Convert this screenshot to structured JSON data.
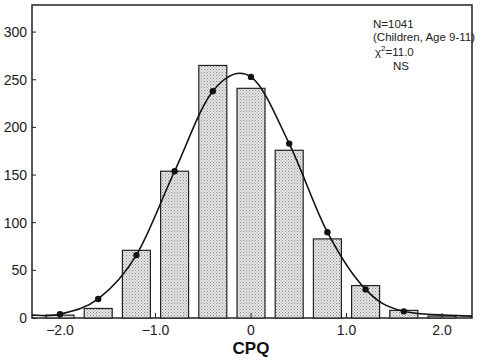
{
  "chart_data": {
    "type": "bar",
    "title": "",
    "xlabel": "CPQ",
    "ylabel": "",
    "xlim": [
      -2.3,
      2.05
    ],
    "ylim": [
      0,
      300
    ],
    "grid": false,
    "x_ticks": [
      -2.0,
      -1.0,
      0,
      1.0,
      2.0
    ],
    "x_tick_labels": [
      "−2.0",
      "−1.0",
      "0",
      "1.0",
      "2.0"
    ],
    "y_ticks": [
      0,
      50,
      100,
      150,
      200,
      250,
      300
    ],
    "y_tick_labels": [
      "0",
      "50",
      "100",
      "150",
      "200",
      "250",
      "300"
    ],
    "categories": [
      -2.0,
      -1.6,
      -1.2,
      -0.8,
      -0.4,
      0.0,
      0.4,
      0.8,
      1.2,
      1.6,
      2.0
    ],
    "series": [
      {
        "name": "Observed frequency",
        "type": "bar",
        "x": [
          -2.0,
          -1.6,
          -1.2,
          -0.8,
          -0.4,
          0.0,
          0.4,
          0.8,
          1.2,
          1.6,
          2.0
        ],
        "values": [
          3,
          10,
          71,
          154,
          265,
          241,
          176,
          83,
          34,
          8,
          2
        ]
      },
      {
        "name": "Fitted normal curve",
        "type": "line",
        "x": [
          -2.0,
          -1.6,
          -1.2,
          -0.8,
          -0.4,
          0.0,
          0.4,
          0.8,
          1.2,
          1.6
        ],
        "values": [
          4,
          20,
          66,
          154,
          238,
          253,
          183,
          90,
          30,
          7
        ]
      }
    ],
    "annotations": [
      "N=1041",
      "(Children, Age 9-11)",
      "χ²=11.0",
      "NS"
    ],
    "legend": null
  },
  "annotation": {
    "n": "N=1041",
    "group": "(Children, Age 9-11)",
    "chi": "χ",
    "chi_sup": "2",
    "chi_val": "=11.0",
    "sig": "NS"
  },
  "colors": {
    "bar_fill": "#d4d4d4",
    "bar_stroke": "#222222",
    "curve": "#111111",
    "axis": "#222222"
  }
}
